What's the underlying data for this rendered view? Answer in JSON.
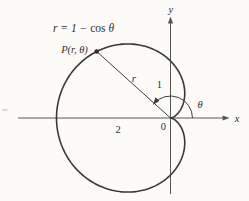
{
  "figure": {
    "equation": {
      "pre": "r = 1 − ",
      "fn": "cos",
      "post": " θ"
    },
    "labels": {
      "point": "P(r, θ)",
      "radius": "r",
      "angle": "θ",
      "origin": "0",
      "x_axis": "x",
      "y_axis": "y",
      "unit_one": "1",
      "unit_two": "2"
    },
    "curve": {
      "type": "polar",
      "equation_text": "r = 1 − cos θ"
    },
    "colors": {
      "ink": "#3b3b3b",
      "axis": "#565656",
      "text": "#2f2f2f",
      "background": "#fcfbf8"
    }
  }
}
